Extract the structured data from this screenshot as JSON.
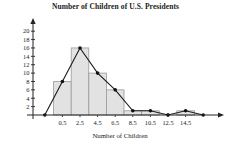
{
  "chart_data": {
    "type": "bar",
    "title": "Number of Children of U.S. Presidents",
    "xlabel": "Number of Children",
    "ylabel": "Number of Presidents",
    "categories": [
      "0.5",
      "2.5",
      "4.5",
      "6.5",
      "8.5",
      "10.5",
      "12.5",
      "14.5"
    ],
    "values": [
      8,
      16,
      10,
      6,
      1,
      1,
      0,
      1
    ],
    "bin_edges": [
      -0.5,
      1.5,
      3.5,
      5.5,
      7.5,
      9.5,
      11.5,
      13.5,
      15.5
    ],
    "bin_width": 2,
    "series": [
      {
        "name": "Frequency polygon",
        "x": [
          -1.5,
          0.5,
          2.5,
          4.5,
          6.5,
          8.5,
          10.5,
          12.5,
          14.5,
          16.5
        ],
        "values": [
          0,
          8,
          16,
          10,
          6,
          1,
          1,
          0,
          1,
          0
        ]
      }
    ],
    "xtick_labels": [
      "0.5",
      "2.5",
      "4.5",
      "6.5",
      "8.5",
      "10.5",
      "12.5",
      "14.5"
    ],
    "xtick_values": [
      0.5,
      2.5,
      4.5,
      6.5,
      8.5,
      10.5,
      12.5,
      14.5
    ],
    "ytick_labels": [
      "2",
      "4",
      "6",
      "8",
      "10",
      "12",
      "14",
      "16",
      "18",
      "20"
    ],
    "ytick_values": [
      2,
      4,
      6,
      8,
      10,
      12,
      14,
      16,
      18,
      20
    ],
    "xlim": [
      -2.5,
      17.5
    ],
    "ylim": [
      0,
      21
    ],
    "grid": false,
    "legend": "none",
    "colors": {
      "bar_fill": "#e2e2e2",
      "bar_edge": "#9a9a9a",
      "line": "#1a1a1a",
      "marker": "#111111",
      "axis": "#222222",
      "text": "#1a1a1a",
      "background": "#ffffff"
    }
  }
}
